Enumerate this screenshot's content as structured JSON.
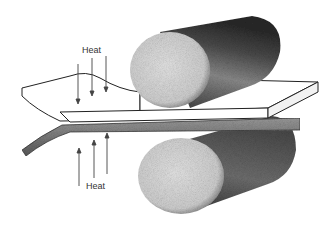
{
  "diagram": {
    "labels": {
      "heat_top": "Heat",
      "heat_bottom": "Heat"
    },
    "components": [
      "upper-roll",
      "lower-roll",
      "workpiece-plate",
      "heat-arrows"
    ],
    "colors": {
      "ink": "#222222",
      "roll_face": "#d8d8d8",
      "roll_body": "#6a6a6a",
      "plate": "#ffffff"
    }
  }
}
